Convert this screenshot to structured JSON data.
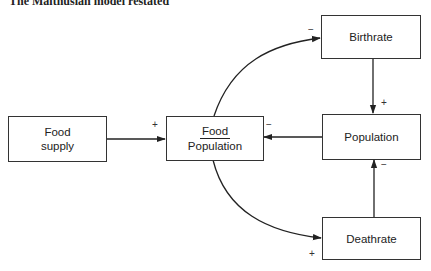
{
  "header": {
    "title": "The Malthusian model restated"
  },
  "nodes": {
    "food_supply": {
      "line1": "Food",
      "line2": "supply"
    },
    "ratio": {
      "numerator": "Food",
      "denominator": "Population"
    },
    "population": {
      "label": "Population"
    },
    "birthrate": {
      "label": "Birthrate"
    },
    "deathrate": {
      "label": "Deathrate"
    }
  },
  "signs": {
    "food_to_ratio": "+",
    "population_to_ratio": "−",
    "ratio_to_birthrate": "−",
    "birthrate_to_population": "+",
    "ratio_to_deathrate": "+",
    "deathrate_to_population": "−"
  },
  "colors": {
    "line": "#222222",
    "box_border": "#333333",
    "background": "#ffffff"
  }
}
